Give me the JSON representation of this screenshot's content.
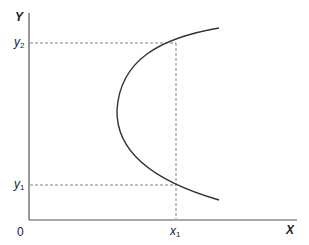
{
  "diagram": {
    "axes": {
      "x_label": "X",
      "y_label": "Y",
      "origin_label": "0"
    },
    "ticks": {
      "y2": {
        "base": "y",
        "sub": "2"
      },
      "y1": {
        "base": "y",
        "sub": "1"
      },
      "x1": {
        "base": "x",
        "sub": "1"
      }
    },
    "curve": {
      "description": "sideways parabola opening right",
      "color": "#333333"
    },
    "colors": {
      "axis": "#555555",
      "dash": "#777777",
      "curve": "#333333"
    }
  }
}
